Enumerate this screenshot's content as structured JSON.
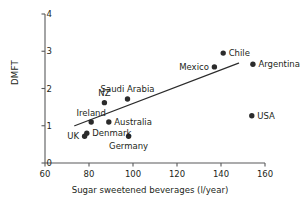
{
  "chart_data": {
    "type": "scatter",
    "title": "",
    "xlabel": "Sugar sweetened beverages (l/year)",
    "ylabel": "DMFT",
    "xlim": [
      60,
      160
    ],
    "ylim": [
      0,
      4
    ],
    "xticks": [
      60,
      80,
      100,
      120,
      140,
      160
    ],
    "yticks": [
      0,
      1,
      2,
      3,
      4
    ],
    "grid": false,
    "legend": "none",
    "marker_color": "#2b2b2b",
    "line_color": "#2b2b2b",
    "axis_color": "#58595b",
    "points": [
      {
        "label": "UK",
        "x": 78.0,
        "y": 0.72,
        "label_pos": "left"
      },
      {
        "label": "Denmark",
        "x": 79.0,
        "y": 0.8,
        "label_pos": "right"
      },
      {
        "label": "Ireland",
        "x": 81.0,
        "y": 1.1,
        "label_pos": "above"
      },
      {
        "label": "NZ",
        "x": 87.0,
        "y": 1.62,
        "label_pos": "above"
      },
      {
        "label": "Australia",
        "x": 89.0,
        "y": 1.1,
        "label_pos": "right"
      },
      {
        "label": "Saudi Arabia",
        "x": 97.5,
        "y": 1.72,
        "label_pos": "above"
      },
      {
        "label": "Germany",
        "x": 98.0,
        "y": 0.72,
        "label_pos": "below"
      },
      {
        "label": "Mexico",
        "x": 137.0,
        "y": 2.58,
        "label_pos": "left"
      },
      {
        "label": "Chile",
        "x": 141.0,
        "y": 2.95,
        "label_pos": "right"
      },
      {
        "label": "Argentina",
        "x": 154.5,
        "y": 2.65,
        "label_pos": "right"
      },
      {
        "label": "USA",
        "x": 154.0,
        "y": 1.27,
        "label_pos": "right"
      }
    ],
    "trendline": {
      "x1": 73.5,
      "y1": 1.0,
      "x2": 148.0,
      "y2": 2.68
    }
  }
}
